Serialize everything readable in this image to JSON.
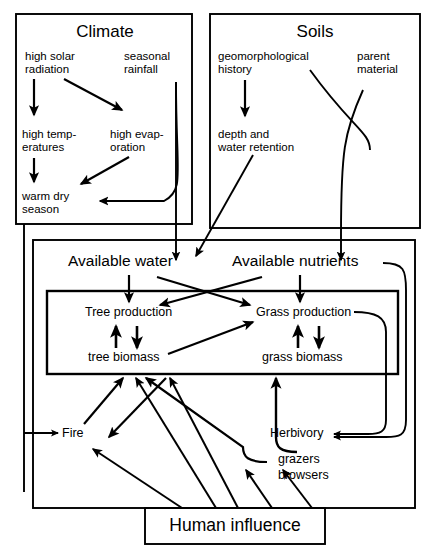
{
  "diagram": {
    "title_climate": "Climate",
    "title_soils": "Soils",
    "nodes": {
      "high_solar_radiation": "high solar\nradiation",
      "seasonal_rainfall": "seasonal\nrainfall",
      "high_temperatures": "high temp-\neratures",
      "high_evaporation": "high evap-\noration",
      "warm_dry_season": "warm dry\nseason",
      "geomorphological_history": "geomorphological\nhistory",
      "parent_material": "parent\nmaterial",
      "depth_water_retention": "depth and\nwater retention",
      "available_water": "Available water",
      "available_nutrients": "Available nutrients",
      "tree_production": "Tree production",
      "grass_production": "Grass production",
      "tree_biomass": "tree biomass",
      "grass_biomass": "grass biomass",
      "fire": "Fire",
      "herbivory": "Herbivory",
      "grazers": "grazers",
      "browsers": "browsers",
      "human_influence": "Human influence"
    },
    "colors": {
      "stroke": "#000000",
      "background": "#ffffff"
    }
  }
}
